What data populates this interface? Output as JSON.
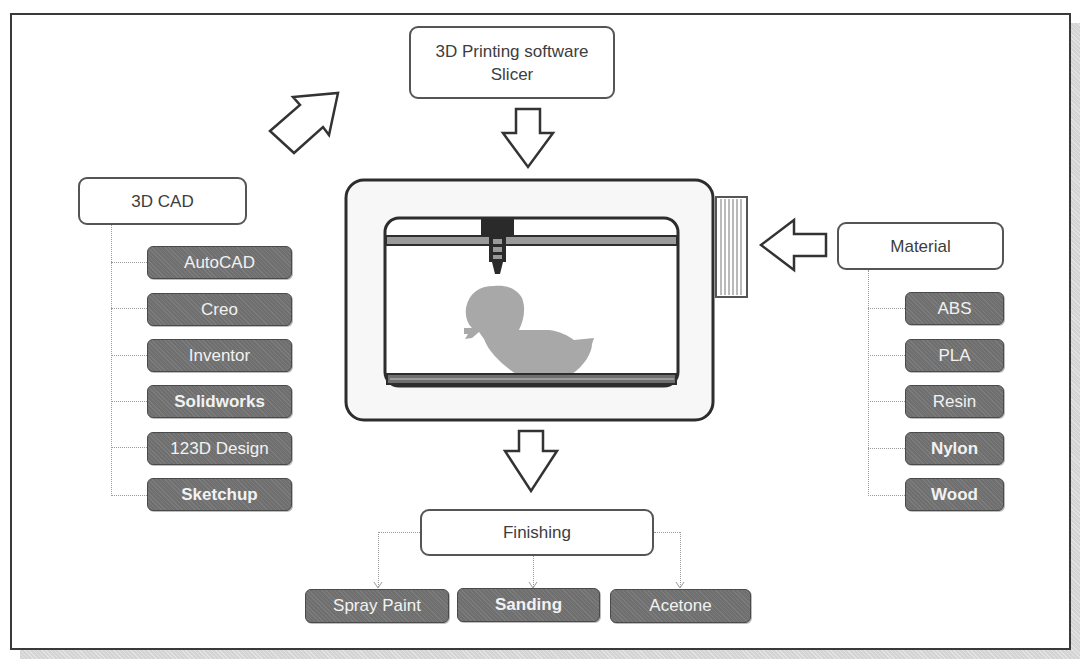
{
  "diagram": {
    "slicer": {
      "line1": "3D Printing software",
      "line2": "Slicer"
    },
    "cad": {
      "label": "3D CAD",
      "items": [
        "AutoCAD",
        "Creo",
        "Inventor",
        "Solidworks",
        "123D Design",
        "Sketchup"
      ]
    },
    "material": {
      "label": "Material",
      "items": [
        "ABS",
        "PLA",
        "Resin",
        "Nylon",
        "Wood"
      ]
    },
    "finishing": {
      "label": "Finishing",
      "items": [
        "Spray Paint",
        "Sanding",
        "Acetone"
      ]
    },
    "printer": {
      "object": "duck-model",
      "icons": [
        "printer-icon",
        "extruder-icon",
        "filament-spool-icon"
      ]
    },
    "arrows": [
      "arrow-cad-to-slicer",
      "arrow-slicer-to-printer",
      "arrow-material-to-printer",
      "arrow-printer-to-finishing"
    ],
    "colors": {
      "leaf_fill": "#6f6f6f",
      "leaf_text": "#f2f2f2",
      "node_border": "#555555",
      "model_gray": "#a8a8a8",
      "frame_border": "#3a3a3a",
      "shadow": "#d4d4d4"
    }
  }
}
